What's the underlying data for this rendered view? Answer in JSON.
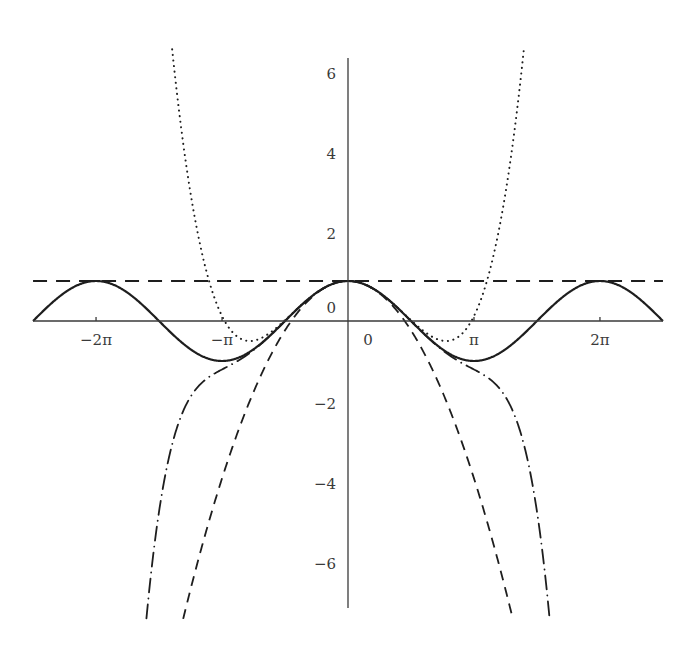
{
  "chart_data": {
    "type": "line",
    "title": "",
    "xlabel": "",
    "ylabel": "",
    "xlim": [
      -7.854,
      7.854
    ],
    "ylim": [
      -7.45,
      6.85
    ],
    "grid": false,
    "legend": null,
    "x_ticks": [
      {
        "value": -6.2832,
        "label": "−2π"
      },
      {
        "value": -3.1416,
        "label": "−π"
      },
      {
        "value": 0,
        "label": "0"
      },
      {
        "value": 3.1416,
        "label": "π"
      },
      {
        "value": 6.2832,
        "label": "2π"
      }
    ],
    "y_ticks": [
      {
        "value": 6,
        "label": "6"
      },
      {
        "value": 4,
        "label": "4"
      },
      {
        "value": 2,
        "label": "2"
      },
      {
        "value": 0,
        "label": "0"
      },
      {
        "value": -2,
        "label": "−2"
      },
      {
        "value": -4,
        "label": "−4"
      },
      {
        "value": -6,
        "label": "−6"
      }
    ],
    "series": [
      {
        "name": "cos(x)",
        "style": "solid",
        "coefficients": "cos",
        "width": 2.2
      },
      {
        "name": "T0 = 1",
        "style": "dashed",
        "coefficients": [
          1
        ],
        "width": 2.0
      },
      {
        "name": "T2 = 1 − x²/2",
        "style": "dashed-short",
        "coefficients": [
          1,
          0,
          -0.5
        ],
        "width": 1.8
      },
      {
        "name": "T4 = 1 − x²/2 + x⁴/24",
        "style": "dotted",
        "coefficients": [
          1,
          0,
          -0.5,
          0,
          0.0416667
        ],
        "width": 2.0
      },
      {
        "name": "T6 = 1 − x²/2 + x⁴/24 − x⁶/720",
        "style": "dash-dot",
        "coefficients": [
          1,
          0,
          -0.5,
          0,
          0.0416667,
          0,
          -0.00138889
        ],
        "width": 1.8
      }
    ],
    "sample_points": {
      "cos(x)": [
        [
          -7.854,
          0
        ],
        [
          -6.283,
          1
        ],
        [
          -3.142,
          -1
        ],
        [
          0,
          1
        ],
        [
          3.142,
          -1
        ],
        [
          6.283,
          1
        ],
        [
          7.854,
          0
        ]
      ],
      "T4_minimum": [
        [
          -2.449,
          -0.5
        ],
        [
          2.449,
          -0.5
        ]
      ]
    }
  },
  "layout": {
    "plot": {
      "x0": 33,
      "x1": 663,
      "y_axis_top": 58,
      "y_axis_bottom": 608,
      "origin_x": 348,
      "origin_y": 321,
      "px_per_unit_x": 40.1,
      "px_per_unit_y": 40
    }
  }
}
